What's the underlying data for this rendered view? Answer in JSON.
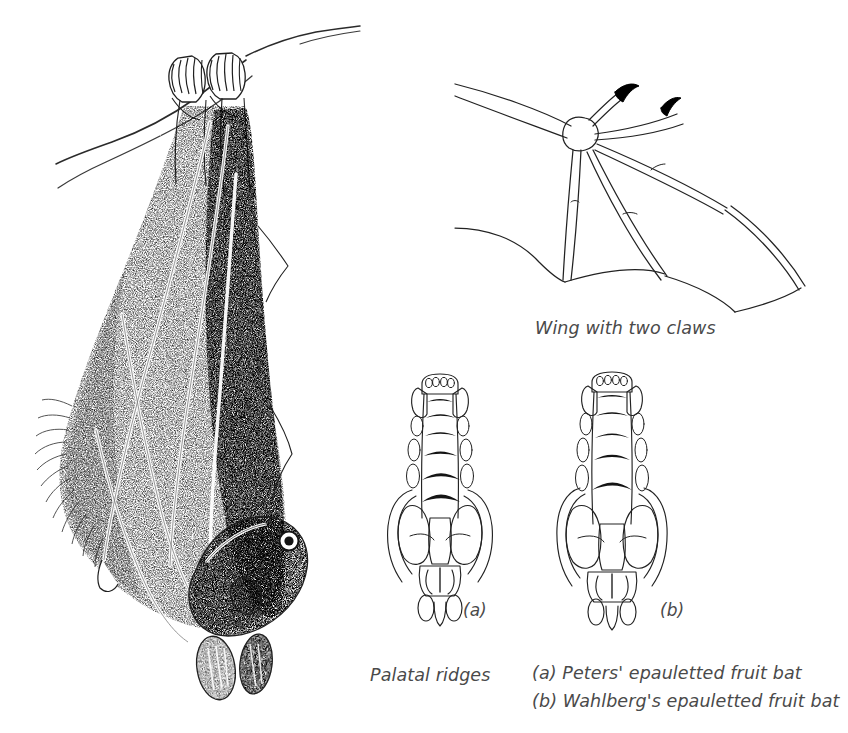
{
  "plate": {
    "background_color": "#ffffff",
    "ink_color": "#1a1a1a",
    "caption_color": "#4a4a4a",
    "subject": "epauletted fruit bats"
  },
  "figures": {
    "hanging_bat": {
      "name": "hanging bat roosting on branch",
      "technique": "stippled pen-and-ink",
      "elements": [
        "branch",
        "two feet gripping branch",
        "folded wings",
        "head with eye and ear",
        "thumb claws"
      ]
    },
    "wing": {
      "name": "outstretched wing showing digits",
      "technique": "line drawing",
      "caption": "Wing with two claws",
      "claw_count": 2,
      "claw_color": "#000000"
    },
    "skull_a": {
      "name": "palate of Peters' epauletted fruit bat",
      "tag": "(a)",
      "incisor_count": 4,
      "ridge_count": 7
    },
    "skull_b": {
      "name": "palate of Wahlberg's epauletted fruit bat",
      "tag": "(b)",
      "incisor_count": 4,
      "ridge_count": 6
    }
  },
  "captions": {
    "wing": "Wing with two claws",
    "palatal_ridges": "Palatal ridges",
    "legend_a": "(a) Peters' epauletted fruit bat",
    "legend_b": "(b) Wahlberg's epauletted fruit bat",
    "tag_a": "(a)",
    "tag_b": "(b)"
  }
}
